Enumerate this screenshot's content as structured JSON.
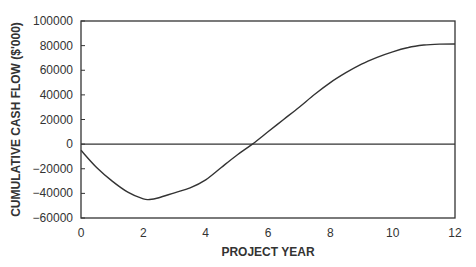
{
  "chart_data": {
    "type": "line",
    "title": "",
    "xlabel": "PROJECT YEAR",
    "ylabel": "CUMULATIVE CASH FLOW ($'000)",
    "xlim": [
      0,
      12
    ],
    "ylim": [
      -60000,
      100000
    ],
    "x_ticks": [
      0,
      2,
      4,
      6,
      8,
      10,
      12
    ],
    "x_tick_labels": [
      "0",
      "2",
      "4",
      "6",
      "8",
      "10",
      "12"
    ],
    "y_ticks": [
      100000,
      80000,
      60000,
      40000,
      20000,
      0,
      -20000,
      -40000,
      -60000
    ],
    "y_tick_labels": [
      "100000",
      "80000",
      "60000",
      "40000",
      "20000",
      "0",
      "−20000",
      "−40000",
      "−60000"
    ],
    "grid": false,
    "legend": null,
    "reference_lines": [
      {
        "axis": "y",
        "value": 0
      }
    ],
    "series": [
      {
        "name": "Cumulative cash flow",
        "color": "#333333",
        "x": [
          0,
          0.5,
          1,
          1.5,
          2,
          2.2,
          2.5,
          3,
          3.5,
          4,
          4.5,
          5,
          5.5,
          6,
          6.5,
          7,
          7.5,
          8,
          8.5,
          9,
          9.5,
          10,
          10.5,
          11,
          11.5,
          12
        ],
        "values": [
          -5000,
          -19000,
          -30000,
          -39000,
          -44500,
          -45000,
          -43500,
          -39500,
          -35500,
          -29000,
          -19000,
          -9000,
          0,
          10000,
          20000,
          30000,
          40500,
          50000,
          58000,
          65000,
          70500,
          75000,
          78500,
          80500,
          81200,
          81300
        ]
      }
    ]
  }
}
